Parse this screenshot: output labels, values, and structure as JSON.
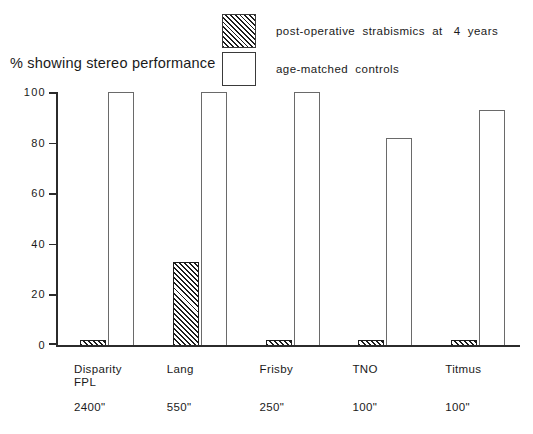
{
  "chart_data": {
    "type": "bar",
    "title": "",
    "ylabel": "% showing stereo performance",
    "xlabel": "",
    "ylim": [
      0,
      100
    ],
    "yticks": [
      0,
      20,
      40,
      60,
      80,
      100
    ],
    "grid": false,
    "legend_position": "top-right",
    "categories": [
      "Disparity\nFPL",
      "Lang",
      "Frisby",
      "TNO",
      "Titmus"
    ],
    "category_sublabels": [
      "2400\"",
      "550\"",
      "250\"",
      "100\"",
      "100\""
    ],
    "series": [
      {
        "name": "post-operative  strabismics  at   4  years",
        "fill": "hatched",
        "values": [
          2,
          33,
          2,
          2,
          2
        ]
      },
      {
        "name": "age-matched  controls",
        "fill": "white",
        "values": [
          100,
          100,
          100,
          82,
          93
        ]
      }
    ]
  },
  "legend": {
    "items": [
      {
        "label": "post-operative  strabismics  at   4  years",
        "swatch": "hatched"
      },
      {
        "label": "age-matched  controls",
        "swatch": "white"
      }
    ]
  },
  "axis": {
    "y_title": "% showing stereo performance",
    "y_tick_labels": [
      "100",
      "80",
      "60",
      "40",
      "20",
      "0"
    ]
  },
  "colors": {
    "axis": "#2b2b2b",
    "bar_outline_control": "#6a6a6a",
    "bar_outline_strabismic": "#1c1c1c",
    "hatch": "#1c1c1c",
    "background": "#ffffff",
    "text": "#1a1a1a"
  }
}
